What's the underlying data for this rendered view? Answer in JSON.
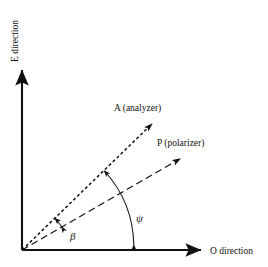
{
  "figure": {
    "background_color": "#ffffff",
    "line_color": "#111111",
    "width": 268,
    "height": 267
  },
  "axes": {
    "origin": {
      "x": 22,
      "y": 250
    },
    "vertical": {
      "label": "E direction",
      "icon": "arrow-up-icon",
      "from": {
        "x": 22,
        "y": 250
      },
      "to": {
        "x": 22,
        "y": 66
      },
      "label_rotation_deg": -90
    },
    "horizontal": {
      "label": "O direction",
      "icon": "arrow-right-icon",
      "from": {
        "x": 22,
        "y": 250
      },
      "to": {
        "x": 205,
        "y": 250
      }
    }
  },
  "vectors": [
    {
      "name": "analyzer",
      "label": "A (analyzer)",
      "dash_style": "dense-dash",
      "dash_pattern": "3,2.5",
      "from": {
        "x": 22,
        "y": 250
      },
      "to": {
        "x": 158,
        "y": 118
      },
      "angle_deg": 44,
      "label_position": {
        "x": 114,
        "y": 110
      }
    },
    {
      "name": "polarizer",
      "label": "P (polarizer)",
      "dash_style": "long-dash",
      "dash_pattern": "7,4",
      "from": {
        "x": 22,
        "y": 250
      },
      "to": {
        "x": 186,
        "y": 155
      },
      "angle_deg": 30,
      "label_position": {
        "x": 157,
        "y": 145
      }
    }
  ],
  "angles": [
    {
      "name": "beta",
      "label": "β",
      "description": "angle between polarizer and analyzer directions",
      "arc_radius": 46,
      "from_deg": 30,
      "to_deg": 44,
      "label_position": {
        "x": 70,
        "y": 238
      }
    },
    {
      "name": "psi",
      "label": "ψ",
      "description": "angle between O direction axis and analyzer direction",
      "arc_radius": 113,
      "from_deg": 0,
      "to_deg": 44,
      "label_position": {
        "x": 136,
        "y": 220
      }
    }
  ]
}
